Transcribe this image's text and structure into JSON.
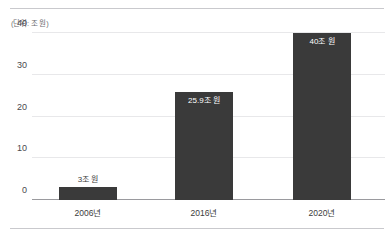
{
  "chart_data": {
    "type": "bar",
    "title": "",
    "subtitle": "",
    "unit_note": "(단위: 조 원)",
    "xlabel": "",
    "ylabel": "",
    "categories": [
      "2006년",
      "2016년",
      "2020년"
    ],
    "values": [
      3,
      25.9,
      40
    ],
    "data_labels": [
      "3조 원",
      "25.9조 원",
      "40조 원"
    ],
    "label_placement": [
      "outside-top",
      "inside-top",
      "inside-top"
    ],
    "ylim": [
      0,
      40
    ],
    "yticks": [
      0,
      10,
      20,
      30,
      40
    ],
    "ytick_labels": [
      "0",
      "10",
      "20",
      "30",
      "40"
    ],
    "grid": true,
    "legend": false,
    "legend_position": "none",
    "bar_color": "#3a3a3a",
    "gridline_color": "#e8e8ea",
    "axis_color": "#9a9a9e",
    "background_color": "#ffffff"
  },
  "decor": {
    "top_rule_color": "#c9c9cd",
    "bottom_rule_color": "#c9c9cd"
  }
}
